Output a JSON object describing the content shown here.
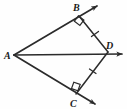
{
  "figure": {
    "kind": "geometry-diagram",
    "width": 127,
    "height": 109,
    "background_color": "#fefefe",
    "stroke_color": "#2b2b2b",
    "label_color": "#1a1a1a"
  },
  "points": [
    {
      "id": "A",
      "label": "A",
      "x": 14,
      "y": 55,
      "label_x": 5,
      "label_y": 58
    },
    {
      "id": "B",
      "label": "B",
      "x": 79,
      "y": 16,
      "label_x": 73,
      "label_y": 10
    },
    {
      "id": "C",
      "label": "C",
      "x": 76,
      "y": 94,
      "label_x": 70,
      "label_y": 106
    },
    {
      "id": "D",
      "label": "D",
      "x": 108,
      "y": 52,
      "label_x": 106,
      "label_y": 48
    }
  ],
  "rays": [
    {
      "id": "ray-AB",
      "from": "A",
      "through": "B",
      "x1": 14,
      "y1": 55,
      "x2": 98,
      "y2": 5,
      "arrow": true
    },
    {
      "id": "ray-AD",
      "from": "A",
      "through": "D",
      "x1": 14,
      "y1": 55,
      "x2": 124,
      "y2": 54,
      "arrow": true
    },
    {
      "id": "ray-AC",
      "from": "A",
      "through": "C",
      "x1": 14,
      "y1": 55,
      "x2": 96,
      "y2": 105,
      "arrow": true
    }
  ],
  "segments": [
    {
      "id": "segment-BD",
      "from": "B",
      "to": "D",
      "x1": 79,
      "y1": 16,
      "x2": 108,
      "y2": 52,
      "ticks": 1
    },
    {
      "id": "segment-DC",
      "from": "D",
      "to": "C",
      "x1": 108,
      "y1": 52,
      "x2": 76,
      "y2": 94,
      "ticks": 1
    }
  ],
  "right_angles": [
    {
      "id": "right-angle-B",
      "at": "B",
      "cx": 79,
      "cy": 16,
      "size": 9
    },
    {
      "id": "right-angle-C",
      "at": "C",
      "cx": 76,
      "cy": 94,
      "size": 9
    }
  ],
  "tick_marks": [
    {
      "id": "tick-BD",
      "on": "segment-BD",
      "x": 95,
      "y": 34
    },
    {
      "id": "tick-DC",
      "on": "segment-DC",
      "x": 93,
      "y": 71
    }
  ]
}
